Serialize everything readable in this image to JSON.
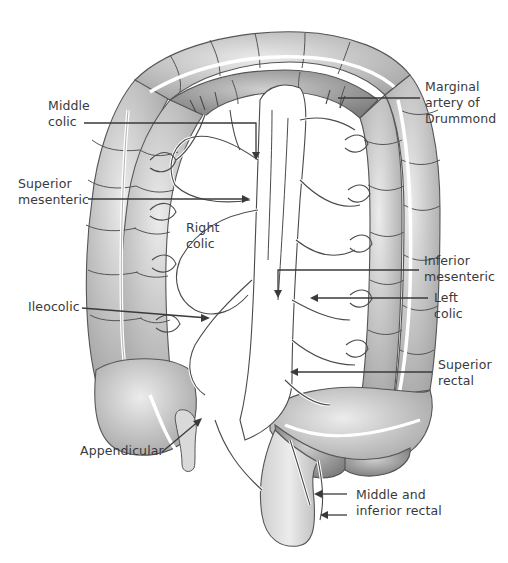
{
  "diagram": {
    "colors": {
      "colon_light": "#c4c4c4",
      "colon_dark": "#9c9c9c",
      "vessel_line": "#4a4a4a",
      "label_text": "#3a3a3a",
      "background": "#ffffff"
    },
    "labels": {
      "middle_colic": "Middle\ncolic",
      "superior_mesenteric": "Superior\nmesenteric",
      "right_colic": "Right\ncolic",
      "ileocolic": "Ileocolic",
      "appendicular": "Appendicular",
      "marginal_artery": "Marginal\nartery of\nDrummond",
      "inferior_mesenteric": "Inferior\nmesenteric",
      "left_colic": "Left\ncolic",
      "superior_rectal": "Superior\nrectal",
      "middle_inferior_rectal": "Middle and\ninferior rectal"
    },
    "structures": [
      "ascending-colon",
      "transverse-colon",
      "descending-colon",
      "sigmoid-colon",
      "rectum",
      "caecum",
      "appendix",
      "aorta",
      "marginal-artery-arcade"
    ]
  }
}
